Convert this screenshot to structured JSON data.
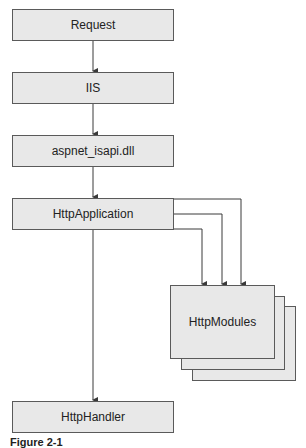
{
  "nodes": {
    "request": "Request",
    "iis": "IIS",
    "isapi": "aspnet_isapi.dll",
    "application": "HttpApplication",
    "modules": "HttpModules",
    "handler": "HttpHandler"
  },
  "caption": "Figure 2-1",
  "colors": {
    "box_fill": "#e8e8e8",
    "box_border": "#5a5a5a",
    "line": "#3a3a3a"
  }
}
